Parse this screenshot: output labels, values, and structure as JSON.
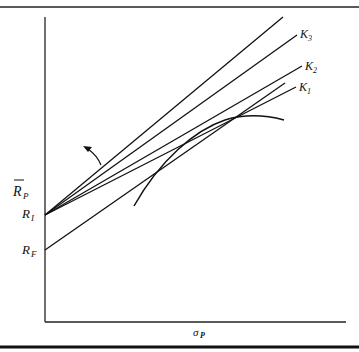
{
  "figure": {
    "type": "capital-market-line-diagram",
    "axes": {
      "y_label_main": "R",
      "y_label_sub": "P",
      "y_label_has_bar": true,
      "x_label_main": "σ",
      "x_label_sub": "P"
    },
    "intercepts": [
      {
        "id": "RI",
        "main": "R",
        "sub": "I"
      },
      {
        "id": "RF",
        "main": "R",
        "sub": "F"
      }
    ],
    "lines": [
      {
        "id": "top",
        "label": null
      },
      {
        "id": "K3",
        "main": "K",
        "sub": "3"
      },
      {
        "id": "K2",
        "main": "K",
        "sub": "2"
      },
      {
        "id": "K1",
        "main": "K",
        "sub": "1"
      },
      {
        "id": "tangent-from-RF",
        "label": null
      }
    ],
    "curve": {
      "id": "efficient-frontier",
      "label": null
    },
    "annotation": {
      "id": "rotation-arrow",
      "direction": "counterclockwise"
    },
    "colors": {
      "ink": "#111111",
      "background": "#ffffff"
    }
  }
}
